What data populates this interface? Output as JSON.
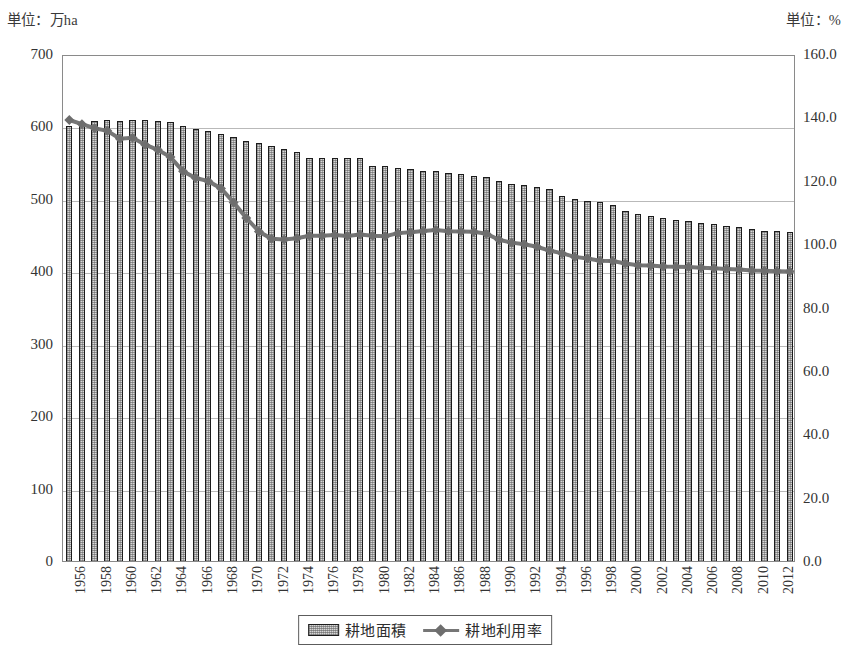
{
  "units": {
    "left": "単位：万ha",
    "right": "単位：%"
  },
  "legend": {
    "bar_label": "耕地面積",
    "line_label": "耕地利用率"
  },
  "colors": {
    "bar_fill": "#d6d6d6",
    "bar_outline": "#1c1c1c",
    "line": "#767676",
    "marker": "#6e6e6e",
    "grid": "#b9b9b9",
    "frame": "#8a8a8a",
    "text": "#333333"
  },
  "chart_data": {
    "type": "bar",
    "title": "",
    "subtitle": "",
    "xlabel": "",
    "ylabel": "単位：万ha",
    "y2label": "単位：%",
    "ylim": [
      0,
      700
    ],
    "y2lim": [
      0,
      160
    ],
    "yticks": [
      "0",
      "100",
      "200",
      "300",
      "400",
      "500",
      "600",
      "700"
    ],
    "y2ticks": [
      "0.0",
      "20.0",
      "40.0",
      "60.0",
      "80.0",
      "100.0",
      "120.0",
      "140.0",
      "160.0"
    ],
    "grid": true,
    "legend_position": "bottom-center",
    "categories": [
      "1956",
      "1957",
      "1958",
      "1959",
      "1960",
      "1961",
      "1962",
      "1963",
      "1964",
      "1965",
      "1966",
      "1967",
      "1968",
      "1969",
      "1970",
      "1971",
      "1972",
      "1973",
      "1974",
      "1975",
      "1976",
      "1977",
      "1978",
      "1979",
      "1980",
      "1981",
      "1982",
      "1983",
      "1984",
      "1985",
      "1986",
      "1987",
      "1988",
      "1989",
      "1990",
      "1991",
      "1992",
      "1993",
      "1994",
      "1995",
      "1996",
      "1997",
      "1998",
      "1999",
      "2000",
      "2001",
      "2002",
      "2003",
      "2004",
      "2005",
      "2006",
      "2007",
      "2008",
      "2009",
      "2010",
      "2011",
      "2012",
      "2013"
    ],
    "xtick_labels": [
      "1956",
      "1958",
      "1960",
      "1962",
      "1964",
      "1966",
      "1968",
      "1970",
      "1972",
      "1974",
      "1976",
      "1978",
      "1980",
      "1982",
      "1984",
      "1986",
      "1988",
      "1990",
      "1992",
      "1994",
      "1996",
      "1998",
      "2000",
      "2002",
      "2004",
      "2006",
      "2008",
      "2010",
      "2012"
    ],
    "series": [
      {
        "name": "耕地面積",
        "kind": "bar",
        "axis": "left",
        "unit": "万ha",
        "values": [
          601,
          604,
          607,
          609,
          607,
          609,
          609,
          607,
          606,
          600,
          597,
          594,
          590,
          585,
          580,
          577,
          573,
          569,
          565,
          557,
          557,
          557,
          557,
          556,
          546,
          545,
          543,
          541,
          539,
          538,
          536,
          534,
          532,
          530,
          524,
          521,
          519,
          517,
          514,
          504,
          500,
          497,
          495,
          491,
          483,
          479,
          476,
          474,
          471,
          469,
          467,
          465,
          463,
          461,
          459,
          456,
          456,
          454
        ]
      },
      {
        "name": "耕地利用率",
        "kind": "line",
        "axis": "right",
        "unit": "%",
        "marker": "diamond",
        "values": [
          139.8,
          138.5,
          137.2,
          136.4,
          133.9,
          134.2,
          132.0,
          130.4,
          128.1,
          123.6,
          121.5,
          120.5,
          118.2,
          113.8,
          108.9,
          104.6,
          102.3,
          102.1,
          102.5,
          103.3,
          103.3,
          103.5,
          103.2,
          103.7,
          103.3,
          103.1,
          104.1,
          104.4,
          104.8,
          105.1,
          104.7,
          104.6,
          104.5,
          103.9,
          102.0,
          101.1,
          100.6,
          99.8,
          98.6,
          97.7,
          96.6,
          96.1,
          95.4,
          95.3,
          94.5,
          94.0,
          93.9,
          93.6,
          93.5,
          93.4,
          93.2,
          93.0,
          92.8,
          92.6,
          92.3,
          92.2,
          92.1,
          92.0
        ]
      }
    ]
  }
}
